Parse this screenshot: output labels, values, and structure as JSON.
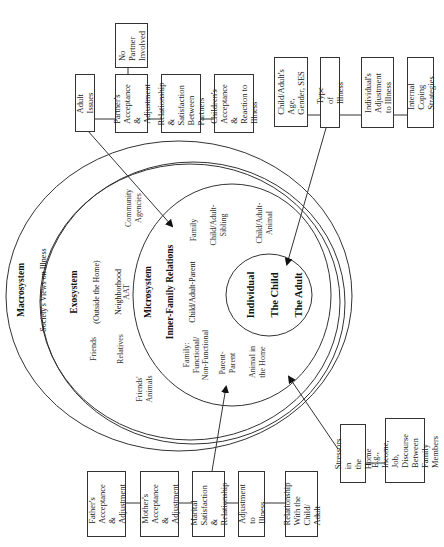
{
  "diagram": {
    "orientation": "rotated-90-ccw",
    "colors": {
      "line": "#333333",
      "background": "#ffffff",
      "text": "#222222"
    },
    "circles": {
      "macrosystem": {
        "title": "Macrosystem",
        "subtitle": "Society's Views on Illness"
      },
      "exosystem": {
        "title": "Exosystem",
        "subtitle": "(Outside the Home)",
        "subtitle2": "Neighborhood",
        "items": {
          "community_agencies": "Community\nAgencies",
          "aat": "AAT",
          "friends": "Friends",
          "relatives": "Relatives",
          "friends_animals": "Friends'\nAnimals"
        }
      },
      "microsystem": {
        "title": "Microsystem",
        "title2": "Inner-Family Relations",
        "subtitle": "Child/Adult-Parent",
        "items": {
          "family": "Family",
          "child_adult_sibling": "Child/Adult-\nSibling",
          "child_adult_animal": "Child/Adult-\nAnimal",
          "family_functional": "Family:\nFunctional/\nNon-Functional",
          "parent_parent": "Parent-\nParent",
          "animal_in_home": "Animal in\nthe Home"
        }
      },
      "individual": {
        "line1": "Individual",
        "line2": "The Child",
        "line3": "The Adult"
      }
    },
    "top_left_boxes": {
      "adult_issues": "Adult Issues",
      "partners_acceptance": "Partner's\nAcceptance &\nAdjustment",
      "no_partner": "No\nPartner\nInvolved",
      "relationship_partners": "Relationship\n& Satisfaction\nBetween\nPartners",
      "childrens_acceptance": "Children's\nAcceptance &\nReaction to\nIllness"
    },
    "top_right_boxes": {
      "age_gender": "Child/Adult's Age,\nGender, SES",
      "type_of_illness": "Type of Illness",
      "individuals_adjustment": "Individual's\nAdjustment\nto Illness",
      "internal_coping": "Internal Coping\nStrategies"
    },
    "bottom_boxes": {
      "fathers": "Father's\nAcceptance\n& Adjustment",
      "mothers": "Mother's\nAcceptance\n& Adjustment",
      "marital": "Marital\nSatisfaction\n& Relationship",
      "adjustment": "Adjustment to\nIllness",
      "relationship_child": "Relationship\nWith the Child/\nAdult",
      "stressors": "Stressors in\nthe Home",
      "examples": "E.g., Income, Job,\nDiscourse\nBetween Family\nMembers"
    }
  }
}
